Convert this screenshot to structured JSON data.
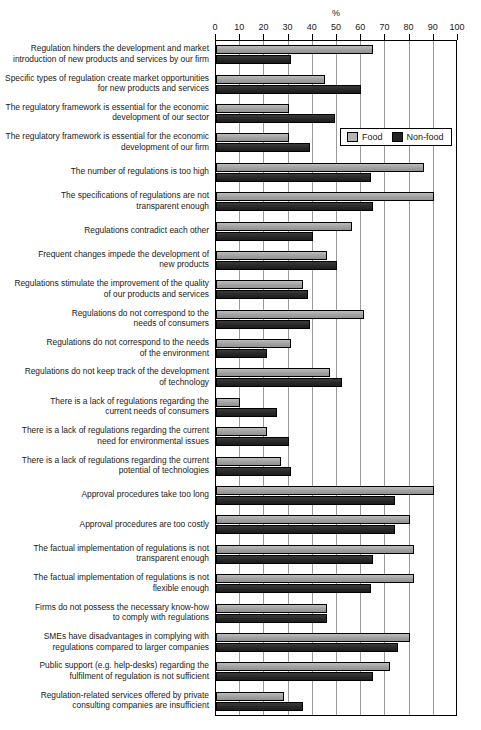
{
  "chart_data": {
    "type": "bar",
    "orientation": "horizontal",
    "title": "",
    "xlabel": "%",
    "ylabel": "",
    "xlim": [
      0,
      100
    ],
    "xticks": [
      0,
      10,
      20,
      30,
      40,
      50,
      60,
      70,
      80,
      90,
      100
    ],
    "grid": true,
    "legend_position": "upper right inside plot",
    "colors": {
      "Food": "#a8a8a8",
      "Non-food": "#2b2b2b"
    },
    "legend": [
      "Food",
      "Non-food"
    ],
    "categories": [
      "Regulation hinders the development and market introduction of new products and services by our firm",
      "Specific types of regulation create market opportunities for new products and services",
      "The regulatory framework is essential for the economic development of our sector",
      "The regulatory framework is essential for the economic development of our firm",
      "The number of regulations is too high",
      "The specifications of regulations are not transparent enough",
      "Regulations contradict each other",
      "Frequent changes impede the development of new products",
      "Regulations stimulate the improvement of the quality of our products and services",
      "Regulations do not correspond to the needs of consumers",
      "Regulations do not correspond to the needs of the environment",
      "Regulations do not keep track of the development of technology",
      "There is a lack of regulations regarding the current needs of consumers",
      "There is a lack of regulations regarding the current need for environmental issues",
      "There is a lack of regulations regarding the current potential of technologies",
      "Approval procedures take too long",
      "Approval procedures are too costly",
      "The factual implementation of regulations is not transparent enough",
      "The factual implementation of regulations is not flexible enough",
      "Firms do not possess the necessary know-how to comply with regulations",
      "SMEs have disadvantages in complying with regulations compared to larger companies",
      "Public support (e.g. help-desks) regarding the fulfilment of regulation is not sufficient",
      "Regulation-related services offered by private consulting companies are insufficient"
    ],
    "series": [
      {
        "name": "Food",
        "values": [
          65,
          45,
          30,
          30,
          86,
          90,
          56,
          46,
          36,
          61,
          31,
          47,
          10,
          21,
          27,
          90,
          80,
          82,
          82,
          46,
          80,
          72,
          28
        ]
      },
      {
        "name": "Non-food",
        "values": [
          31,
          60,
          49,
          39,
          64,
          65,
          40,
          50,
          38,
          39,
          21,
          52,
          25,
          30,
          31,
          74,
          74,
          65,
          64,
          46,
          75,
          65,
          36
        ]
      }
    ]
  },
  "rows": [
    {
      "label_lines": [
        "Regulation hinders the development and market",
        "introduction of new products and services by our firm"
      ]
    },
    {
      "label_lines": [
        "Specific types of regulation create market opportunities",
        "for new products and services"
      ]
    },
    {
      "label_lines": [
        "The regulatory framework is essential for the economic",
        "development of our sector"
      ]
    },
    {
      "label_lines": [
        "The regulatory framework is essential for the economic",
        "development of our firm"
      ]
    },
    {
      "label_lines": [
        "The number of regulations is too high"
      ]
    },
    {
      "label_lines": [
        "The specifications of regulations are not",
        "transparent enough"
      ]
    },
    {
      "label_lines": [
        "Regulations contradict each other"
      ]
    },
    {
      "label_lines": [
        "Frequent changes impede the development of",
        "new products"
      ]
    },
    {
      "label_lines": [
        "Regulations stimulate the improvement of the quality",
        "of our products and services"
      ]
    },
    {
      "label_lines": [
        "Regulations do not correspond to the",
        "needs of consumers"
      ]
    },
    {
      "label_lines": [
        "Regulations do not correspond to the needs",
        "of the environment"
      ]
    },
    {
      "label_lines": [
        "Regulations do not keep track of the development",
        "of technology"
      ]
    },
    {
      "label_lines": [
        "There is a lack of regulations regarding the",
        "current needs of consumers"
      ]
    },
    {
      "label_lines": [
        "There is a lack of regulations regarding the current",
        "need for environmental issues"
      ]
    },
    {
      "label_lines": [
        "There is a lack of regulations regarding the current",
        "potential of technologies"
      ]
    },
    {
      "label_lines": [
        "Approval procedures take too long"
      ]
    },
    {
      "label_lines": [
        "Approval procedures are too costly"
      ]
    },
    {
      "label_lines": [
        "The factual implementation of regulations is not",
        "transparent enough"
      ]
    },
    {
      "label_lines": [
        "The factual implementation of regulations is not",
        "flexible enough"
      ]
    },
    {
      "label_lines": [
        "Firms do not possess the necessary know-how",
        "to comply with regulations"
      ]
    },
    {
      "label_lines": [
        "SMEs have disadvantages in complying with",
        "regulations compared to larger companies"
      ]
    },
    {
      "label_lines": [
        "Public support (e.g. help-desks) regarding the",
        "fulfilment of regulation is not sufficient"
      ]
    },
    {
      "label_lines": [
        "Regulation-related services offered by private",
        "consulting companies are insufficient"
      ]
    }
  ]
}
